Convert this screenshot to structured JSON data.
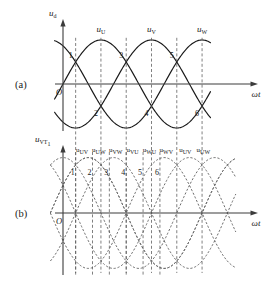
{
  "figure": {
    "panel_a_label": "(a)",
    "panel_b_label": "(b)",
    "origin_label_a": "O",
    "origin_label_b": "O",
    "x_axis_label_a": "ωt",
    "x_axis_label_b": "ωt",
    "y_axis_label_a_base": "u",
    "y_axis_label_a_sub": "d",
    "y_axis_label_b_base": "u",
    "y_axis_label_b_sub": "VT",
    "y_axis_label_b_sub2": "1"
  },
  "chart_data": [
    {
      "type": "line",
      "id": "panel-a-phase-voltages",
      "title": "(a)",
      "xlabel": "ωt",
      "ylabel": "u_d",
      "grid": false,
      "legend": "inline-curve-labels",
      "xlim_deg": [
        0,
        420
      ],
      "ylim": [
        -1.15,
        1.15
      ],
      "series": [
        {
          "name": "u_U",
          "label_base": "u",
          "label_sub": "U",
          "phase_deg": 0,
          "amplitude": 1.0,
          "label_x_deg": 90,
          "style": "solid"
        },
        {
          "name": "u_V",
          "label_base": "u",
          "label_sub": "V",
          "phase_deg": 120,
          "amplitude": 1.0,
          "label_x_deg": 210,
          "style": "solid"
        },
        {
          "name": "u_W",
          "label_base": "u",
          "label_sub": "W",
          "phase_deg": 240,
          "amplitude": 1.0,
          "label_x_deg": 330,
          "style": "solid"
        }
      ],
      "intersection_points": [
        {
          "n": "1",
          "x_deg": 30,
          "side": "above"
        },
        {
          "n": "2",
          "x_deg": 90,
          "side": "below"
        },
        {
          "n": "3",
          "x_deg": 150,
          "side": "above"
        },
        {
          "n": "4",
          "x_deg": 210,
          "side": "below"
        },
        {
          "n": "5",
          "x_deg": 270,
          "side": "above"
        },
        {
          "n": "6",
          "x_deg": 330,
          "side": "below"
        }
      ],
      "commutation_lines_deg": [
        30,
        90,
        150,
        210,
        270,
        330
      ]
    },
    {
      "type": "line",
      "id": "panel-b-line-voltages",
      "title": "(b)",
      "xlabel": "ωt",
      "ylabel": "u_VT1",
      "grid": false,
      "legend": "top-row-labels",
      "xlim_deg": [
        0,
        420
      ],
      "ylim": [
        -1.9,
        1.9
      ],
      "style": "dashed",
      "series": [
        {
          "name": "u_UV",
          "label_base": "u",
          "label_sub": "UV",
          "phase_deg": 30,
          "amplitude": 1.732,
          "style": "dashed"
        },
        {
          "name": "u_UW",
          "label_base": "u",
          "label_sub": "UW",
          "phase_deg": -30,
          "amplitude": 1.732,
          "style": "dashed"
        },
        {
          "name": "u_VW",
          "label_base": "u",
          "label_sub": "VW",
          "phase_deg": 150,
          "amplitude": 1.732,
          "style": "dashed"
        },
        {
          "name": "u_VU",
          "label_base": "u",
          "label_sub": "VU",
          "phase_deg": 210,
          "amplitude": 1.732,
          "style": "dashed"
        },
        {
          "name": "u_WU",
          "label_base": "u",
          "label_sub": "WU",
          "phase_deg": 270,
          "amplitude": 1.732,
          "style": "dashed"
        },
        {
          "name": "u_WV",
          "label_base": "u",
          "label_sub": "WV",
          "phase_deg": 330,
          "amplitude": 1.732,
          "style": "dashed"
        }
      ],
      "top_labels": [
        {
          "text_base": "u",
          "text_sub": "UV",
          "x_deg": 45
        },
        {
          "text_base": "u",
          "text_sub": "UW",
          "x_deg": 85
        },
        {
          "text_base": "u",
          "text_sub": "VW",
          "x_deg": 125
        },
        {
          "text_base": "u",
          "text_sub": "VU",
          "x_deg": 165
        },
        {
          "text_base": "u",
          "text_sub": "WU",
          "x_deg": 205
        },
        {
          "text_base": "u",
          "text_sub": "WV",
          "x_deg": 245
        },
        {
          "text_base": "u",
          "text_sub": "UV",
          "x_deg": 290
        },
        {
          "text_base": "u",
          "text_sub": "UW",
          "x_deg": 333
        }
      ],
      "numbered_points": [
        {
          "n": "1",
          "x_deg": 30
        },
        {
          "n": "2",
          "x_deg": 70
        },
        {
          "n": "3",
          "x_deg": 110
        },
        {
          "n": "4",
          "x_deg": 150
        },
        {
          "n": "5",
          "x_deg": 190
        },
        {
          "n": "6",
          "x_deg": 230
        }
      ],
      "commutation_lines_deg": [
        30,
        70,
        110,
        150,
        190,
        230
      ]
    }
  ],
  "colors": {
    "axis": "#3c3c3c",
    "solid_curve": "#1a1a1a",
    "dashed_curve": "#6b6b6b",
    "vline": "#555555",
    "background": "#ffffff",
    "text": "#1a1a1a"
  }
}
